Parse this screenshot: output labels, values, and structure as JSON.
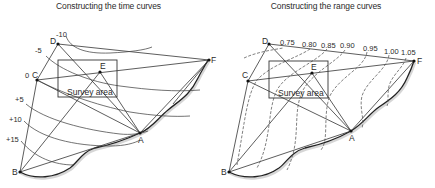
{
  "left_panel": {
    "title": "Constructing the time curves",
    "points": {
      "A": "A",
      "B": "B",
      "C": "C",
      "D": "D",
      "E": "E",
      "F": "F"
    },
    "survey_area_label": "Survey area",
    "curve_labels": [
      "-10",
      "-5",
      "0",
      "+5",
      "+10",
      "+15"
    ]
  },
  "right_panel": {
    "title": "Constructing the range curves",
    "points": {
      "A": "A",
      "B": "B",
      "C": "C",
      "D": "D",
      "E": "E",
      "F": "F"
    },
    "survey_area_label": "Survey area",
    "curve_labels": [
      "0.75",
      "0.80",
      "0.85",
      "0.90",
      "0.95",
      "1.00",
      "1.05"
    ]
  }
}
